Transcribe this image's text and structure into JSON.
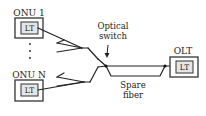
{
  "diagram": {
    "onu_top": {
      "label": "ONU 1",
      "inner_label": "LT"
    },
    "onu_bottom": {
      "label": "ONU N",
      "inner_label": "LT"
    },
    "olt": {
      "label": "OLT",
      "inner_label": "LT"
    },
    "switch_label_line1": "Optical",
    "switch_label_line2": "switch",
    "spare_label_line1": "Spare",
    "spare_label_line2": "fiber",
    "ellipsis_dots": 3,
    "colors": {
      "line": "#222222",
      "box_border": "#333333",
      "inner_fill": "#e6e6e6",
      "background": "#ffffff"
    }
  }
}
